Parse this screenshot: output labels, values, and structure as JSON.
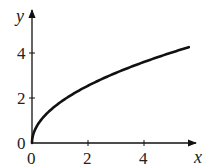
{
  "chart_data": {
    "type": "line",
    "title": "",
    "xlabel": "x",
    "ylabel": "y",
    "xlim": [
      0,
      5.9
    ],
    "ylim": [
      0,
      5.6
    ],
    "x_ticks": [
      0,
      2,
      4
    ],
    "y_ticks": [
      0,
      2,
      4
    ],
    "x_tick_labels": [
      "0",
      "2",
      "4"
    ],
    "y_tick_labels": [
      "0",
      "2",
      "4"
    ],
    "grid": false,
    "legend": null,
    "series": [
      {
        "name": "curve",
        "color": "#111111",
        "x": [
          0,
          0.05,
          0.25,
          0.5,
          1,
          1.5,
          2,
          2.5,
          3,
          3.5,
          4,
          4.5,
          5,
          5.6
        ],
        "y": [
          0,
          0.4,
          0.9,
          1.27,
          1.8,
          2.2,
          2.55,
          2.85,
          3.12,
          3.37,
          3.6,
          3.82,
          4.02,
          4.26
        ]
      }
    ]
  },
  "axes": {
    "x_label": "x",
    "y_label": "y",
    "origin_x_label": "0",
    "origin_y_label": "0",
    "x_tick_2": "2",
    "x_tick_4": "4",
    "y_tick_2": "2",
    "y_tick_4": "4"
  }
}
